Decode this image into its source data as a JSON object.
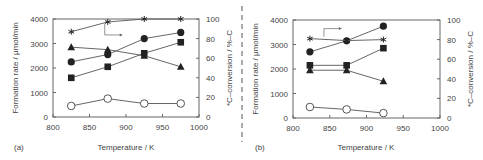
{
  "chart_data": [
    {
      "panel": "(a)",
      "type": "line",
      "xlabel": "Temperature / K",
      "ylabel": "Formation rate / μmol/min",
      "y2label": "*C–conversion / %–C",
      "xlim": [
        800,
        1000
      ],
      "ylim": [
        0,
        4000
      ],
      "y2lim": [
        0,
        100
      ],
      "xticks": [
        "800",
        "850",
        "900",
        "950",
        "1000"
      ],
      "yticks": [
        "0",
        "1000",
        "2000",
        "3000",
        "4000"
      ],
      "y2ticks": [
        "0",
        "20",
        "40",
        "60",
        "80",
        "100"
      ],
      "grid": false,
      "x": [
        825,
        875,
        925,
        975
      ],
      "series": [
        {
          "name": "filled-circle",
          "marker": "circle-filled",
          "axis": "left",
          "values": [
            2250,
            2550,
            3200,
            3450
          ]
        },
        {
          "name": "filled-triangle",
          "marker": "triangle-filled",
          "axis": "left",
          "values": [
            2850,
            2750,
            2500,
            2050
          ]
        },
        {
          "name": "filled-square",
          "marker": "square-filled",
          "axis": "left",
          "values": [
            1600,
            2050,
            2600,
            3050
          ]
        },
        {
          "name": "open-circle",
          "marker": "circle-open",
          "axis": "left",
          "values": [
            450,
            750,
            550,
            550
          ]
        },
        {
          "name": "star-conversion",
          "marker": "star",
          "axis": "right",
          "values": [
            87,
            97,
            100,
            100
          ]
        }
      ],
      "annotation": "bracket arrow pointing from star series to right axis"
    },
    {
      "panel": "(b)",
      "type": "line",
      "xlabel": "Temperature / K",
      "ylabel": "Formation rate / μmol/min",
      "y2label": "*C–conversion / %–C",
      "xlim": [
        800,
        1000
      ],
      "ylim": [
        0,
        4000
      ],
      "y2lim": [
        0,
        100
      ],
      "xticks": [
        "800",
        "850",
        "900",
        "950",
        "1000"
      ],
      "yticks": [
        "0",
        "1000",
        "2000",
        "3000",
        "4000"
      ],
      "y2ticks": [
        "0",
        "20",
        "40",
        "60",
        "80",
        "100"
      ],
      "grid": false,
      "x": [
        823,
        873,
        923
      ],
      "series": [
        {
          "name": "filled-circle",
          "marker": "circle-filled",
          "axis": "left",
          "values": [
            2700,
            3150,
            3750
          ]
        },
        {
          "name": "filled-triangle",
          "marker": "triangle-filled",
          "axis": "left",
          "values": [
            1950,
            1950,
            1500
          ]
        },
        {
          "name": "filled-square",
          "marker": "square-filled",
          "axis": "left",
          "values": [
            2150,
            2150,
            2850
          ]
        },
        {
          "name": "open-circle",
          "marker": "circle-open",
          "axis": "left",
          "values": [
            450,
            350,
            200
          ]
        },
        {
          "name": "star-conversion",
          "marker": "star",
          "axis": "right",
          "values": [
            81,
            79,
            80
          ]
        }
      ],
      "annotation": "bracket arrow pointing from star series to right axis"
    }
  ],
  "colors": {
    "ink": "#222222",
    "frame": "#666666",
    "text": "#444444",
    "background": "#ffffff"
  }
}
